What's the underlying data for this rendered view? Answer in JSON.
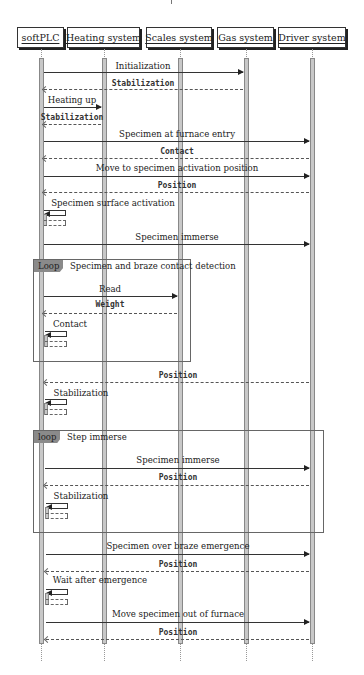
{
  "diagram": {
    "type": "sequence",
    "actors": [
      {
        "id": "softplc",
        "label": "softPLC",
        "x": 41,
        "left": 17,
        "width": 47
      },
      {
        "id": "heating",
        "label": "Heating system",
        "x": 104,
        "left": 67,
        "width": 73
      },
      {
        "id": "scales",
        "label": "Scales system",
        "x": 180,
        "left": 146,
        "width": 66
      },
      {
        "id": "gas",
        "label": "Gas system",
        "x": 246,
        "left": 217,
        "width": 57
      },
      {
        "id": "driver",
        "label": "Driver system",
        "x": 312,
        "left": 278,
        "width": 68
      }
    ],
    "messages": [
      {
        "from": "softPLC",
        "to": "Gas system",
        "label": "Initialization",
        "kind": "call",
        "y": 72
      },
      {
        "from": "Gas system",
        "to": "softPLC",
        "label": "Stabilization",
        "kind": "return",
        "y": 89
      },
      {
        "from": "softPLC",
        "to": "Heating system",
        "label": "Heating up",
        "kind": "call",
        "y": 107
      },
      {
        "from": "Heating system",
        "to": "softPLC",
        "label": "Stabilization",
        "kind": "return",
        "y": 124
      },
      {
        "from": "softPLC",
        "to": "Driver system",
        "label": "Specimen at furnace entry",
        "kind": "call",
        "y": 141
      },
      {
        "from": "Driver system",
        "to": "softPLC",
        "label": "Contact",
        "kind": "return",
        "y": 158
      },
      {
        "from": "softPLC",
        "to": "Driver system",
        "label": "Move to specimen activation position",
        "kind": "call",
        "y": 176
      },
      {
        "from": "Driver system",
        "to": "softPLC",
        "label": "Position",
        "kind": "return",
        "y": 192
      },
      {
        "from": "softPLC",
        "to": "softPLC",
        "label": "Specimen surface activation",
        "kind": "self",
        "y": 210
      },
      {
        "from": "softPLC",
        "to": "Driver system",
        "label": "Specimen immerse",
        "kind": "call",
        "y": 244
      },
      {
        "from": "softPLC",
        "to": "Scales system",
        "label": "Read",
        "kind": "call",
        "y": 296
      },
      {
        "from": "Scales system",
        "to": "softPLC",
        "label": "Weight",
        "kind": "return",
        "y": 313
      },
      {
        "from": "softPLC",
        "to": "softPLC",
        "label": "Contact",
        "kind": "self",
        "y": 331
      },
      {
        "from": "Driver system",
        "to": "softPLC",
        "label": "Position",
        "kind": "return",
        "y": 382
      },
      {
        "from": "softPLC",
        "to": "softPLC",
        "label": "Stabilization",
        "kind": "self",
        "y": 399
      },
      {
        "from": "softPLC",
        "to": "Driver system",
        "label": "Specimen immerse",
        "kind": "call",
        "y": 468
      },
      {
        "from": "Driver system",
        "to": "softPLC",
        "label": "Position",
        "kind": "return",
        "y": 485
      },
      {
        "from": "softPLC",
        "to": "softPLC",
        "label": "Stabilization",
        "kind": "self",
        "y": 503
      },
      {
        "from": "softPLC",
        "to": "Driver system",
        "label": "Specimen over braze emergence",
        "kind": "call",
        "y": 554
      },
      {
        "from": "Driver system",
        "to": "softPLC",
        "label": "Position",
        "kind": "return",
        "y": 571
      },
      {
        "from": "softPLC",
        "to": "softPLC",
        "label": "Wait after emergence",
        "kind": "self",
        "y": 589
      },
      {
        "from": "softPLC",
        "to": "Driver system",
        "label": "Move specimen out of furnace",
        "kind": "call",
        "y": 622
      },
      {
        "from": "Driver system",
        "to": "softPLC",
        "label": "Position",
        "kind": "return",
        "y": 639
      }
    ],
    "frames": [
      {
        "tag": "Loop",
        "title": "Specimen and braze contact detection",
        "left": 33,
        "top": 259,
        "width": 158,
        "height": 103
      },
      {
        "tag": "loop",
        "title": "Step immerse",
        "left": 33,
        "top": 430,
        "width": 291,
        "height": 103
      }
    ]
  },
  "colors": {
    "activation_bar": "#c8c8c8",
    "frame_tag": "#8a8a8a",
    "line": "#333333"
  }
}
